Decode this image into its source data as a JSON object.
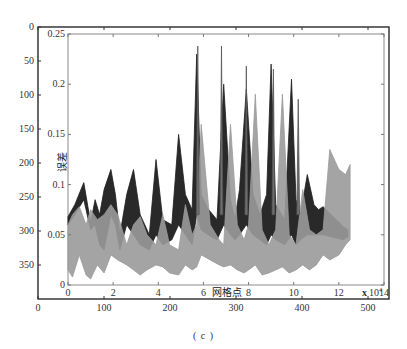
{
  "caption": "( c )",
  "chart_data": {
    "type": "area",
    "title": "",
    "xlabel": "网格点",
    "ylabel": "误差",
    "x_scale_note": "x 10^4",
    "xlim": [
      0,
      14
    ],
    "ylim": [
      0,
      0.25
    ],
    "x_ticks": [
      0,
      2,
      4,
      6,
      8,
      10,
      12,
      14
    ],
    "y_ticks": [
      0,
      0.05,
      0.1,
      0.15,
      0.2,
      0.25
    ],
    "outer_axes": {
      "x_ticks": [
        0,
        100,
        200,
        300,
        400,
        500
      ],
      "y_ticks": [
        0,
        50,
        100,
        150,
        200,
        250,
        300,
        350
      ],
      "y_inverted": true
    },
    "series": [
      {
        "name": "dark band (upper error)",
        "color": "#1e1e1e",
        "x": [
          0,
          0.3,
          0.7,
          1.0,
          1.2,
          1.4,
          1.6,
          1.9,
          2.1,
          2.3,
          2.6,
          2.9,
          3.2,
          3.6,
          3.9,
          4.2,
          4.6,
          4.9,
          5.2,
          5.5,
          5.7,
          5.9,
          6.2,
          6.6,
          6.9,
          7.2,
          7.4,
          7.6,
          7.9,
          8.2,
          8.5,
          8.8,
          9.0,
          9.2,
          9.6,
          9.9,
          10.1,
          10.3,
          10.6,
          10.9,
          11.1,
          11.3,
          12.2,
          12.4
        ],
        "upper": [
          0.068,
          0.08,
          0.102,
          0.062,
          0.085,
          0.07,
          0.095,
          0.115,
          0.09,
          0.05,
          0.09,
          0.115,
          0.07,
          0.05,
          0.125,
          0.065,
          0.06,
          0.15,
          0.09,
          0.075,
          0.23,
          0.09,
          0.076,
          0.065,
          0.2,
          0.085,
          0.066,
          0.095,
          0.195,
          0.09,
          0.07,
          0.09,
          0.22,
          0.08,
          0.065,
          0.205,
          0.085,
          0.07,
          0.11,
          0.08,
          0.075,
          0.078,
          0.058,
          0.055
        ],
        "lower": [
          0.06,
          0.07,
          0.085,
          0.055,
          0.06,
          0.04,
          0.035,
          0.07,
          0.06,
          0.035,
          0.06,
          0.05,
          0.04,
          0.035,
          0.05,
          0.04,
          0.045,
          0.06,
          0.05,
          0.04,
          0.07,
          0.055,
          0.05,
          0.045,
          0.06,
          0.05,
          0.045,
          0.05,
          0.06,
          0.05,
          0.045,
          0.04,
          0.05,
          0.045,
          0.04,
          0.05,
          0.04,
          0.045,
          0.05,
          0.05,
          0.05,
          0.05,
          0.045,
          0.048
        ]
      },
      {
        "name": "gray band (lower error)",
        "color": "#9a9a9a",
        "x": [
          0,
          0.2,
          0.5,
          0.8,
          1.0,
          1.3,
          1.6,
          1.9,
          2.2,
          2.6,
          2.9,
          3.2,
          3.5,
          3.9,
          4.2,
          4.5,
          4.9,
          5.2,
          5.5,
          5.7,
          5.9,
          6.3,
          6.7,
          6.9,
          7.2,
          7.5,
          7.8,
          8.0,
          8.3,
          8.6,
          8.9,
          9.2,
          9.5,
          9.8,
          10.1,
          10.4,
          10.7,
          11.0,
          11.3,
          11.6,
          12.0,
          12.3,
          12.5
        ],
        "upper": [
          0.06,
          0.07,
          0.078,
          0.06,
          0.075,
          0.065,
          0.07,
          0.08,
          0.07,
          0.04,
          0.06,
          0.068,
          0.05,
          0.04,
          0.07,
          0.04,
          0.035,
          0.08,
          0.05,
          0.06,
          0.16,
          0.06,
          0.045,
          0.04,
          0.16,
          0.06,
          0.045,
          0.06,
          0.19,
          0.055,
          0.04,
          0.055,
          0.19,
          0.05,
          0.04,
          0.095,
          0.055,
          0.05,
          0.055,
          0.135,
          0.115,
          0.11,
          0.12
        ],
        "lower": [
          0.015,
          0.008,
          0.03,
          0.01,
          0.006,
          0.02,
          0.012,
          0.03,
          0.025,
          0.02,
          0.015,
          0.01,
          0.015,
          0.02,
          0.018,
          0.012,
          0.01,
          0.02,
          0.015,
          0.018,
          0.03,
          0.025,
          0.02,
          0.018,
          0.02,
          0.015,
          0.012,
          0.015,
          0.02,
          0.01,
          0.012,
          0.015,
          0.018,
          0.012,
          0.015,
          0.02,
          0.015,
          0.02,
          0.03,
          0.025,
          0.03,
          0.04,
          0.045
        ]
      }
    ],
    "peaks": [
      {
        "x": 5.75,
        "y": 0.238
      },
      {
        "x": 6.8,
        "y": 0.238
      },
      {
        "x": 7.9,
        "y": 0.218
      },
      {
        "x": 9.1,
        "y": 0.215
      },
      {
        "x": 10.2,
        "y": 0.185
      }
    ],
    "grid": false,
    "legend": null
  }
}
